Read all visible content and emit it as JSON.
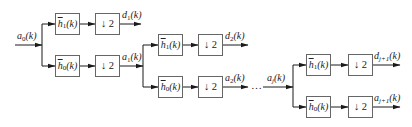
{
  "diagram": {
    "type": "wavelet-decomposition-filter-bank",
    "stage1": {
      "input": {
        "base": "a",
        "sub": "0",
        "arg": "(k)"
      },
      "high_filter": {
        "base": "h",
        "sub": "1",
        "arg": "(k)"
      },
      "low_filter": {
        "base": "h",
        "sub": "0",
        "arg": "(k)"
      },
      "downsample_high": "↓ 2",
      "downsample_low": "↓ 2",
      "detail_output": {
        "base": "d",
        "sub": "1",
        "arg": "(k)"
      },
      "approx_output": {
        "base": "a",
        "sub": "1",
        "arg": "(k)"
      }
    },
    "stage2": {
      "high_filter": {
        "base": "h",
        "sub": "1",
        "arg": "(k)"
      },
      "low_filter": {
        "base": "h",
        "sub": "0",
        "arg": "(k)"
      },
      "downsample_high": "↓ 2",
      "downsample_low": "↓ 2",
      "detail_output": {
        "base": "d",
        "sub": "2",
        "arg": "(k)"
      },
      "approx_output": {
        "base": "a",
        "sub": "2",
        "arg": "(k)"
      }
    },
    "ellipsis": "…",
    "stage3": {
      "input": {
        "base": "a",
        "sub": "j",
        "arg": "(k)"
      },
      "high_filter": {
        "base": "h",
        "sub": "1",
        "arg": "(k)"
      },
      "low_filter": {
        "base": "h",
        "sub": "0",
        "arg": "(k)"
      },
      "downsample_high": "↓ 2",
      "downsample_low": "↓ 2",
      "detail_output": {
        "base": "d",
        "sub": "j+1",
        "arg": "(k)"
      },
      "approx_output": {
        "base": "a",
        "sub": "j+1",
        "arg": "(k)"
      }
    },
    "colors": {
      "line": "#1a1a1a",
      "box_border": "#666666",
      "text": "#222222"
    }
  }
}
